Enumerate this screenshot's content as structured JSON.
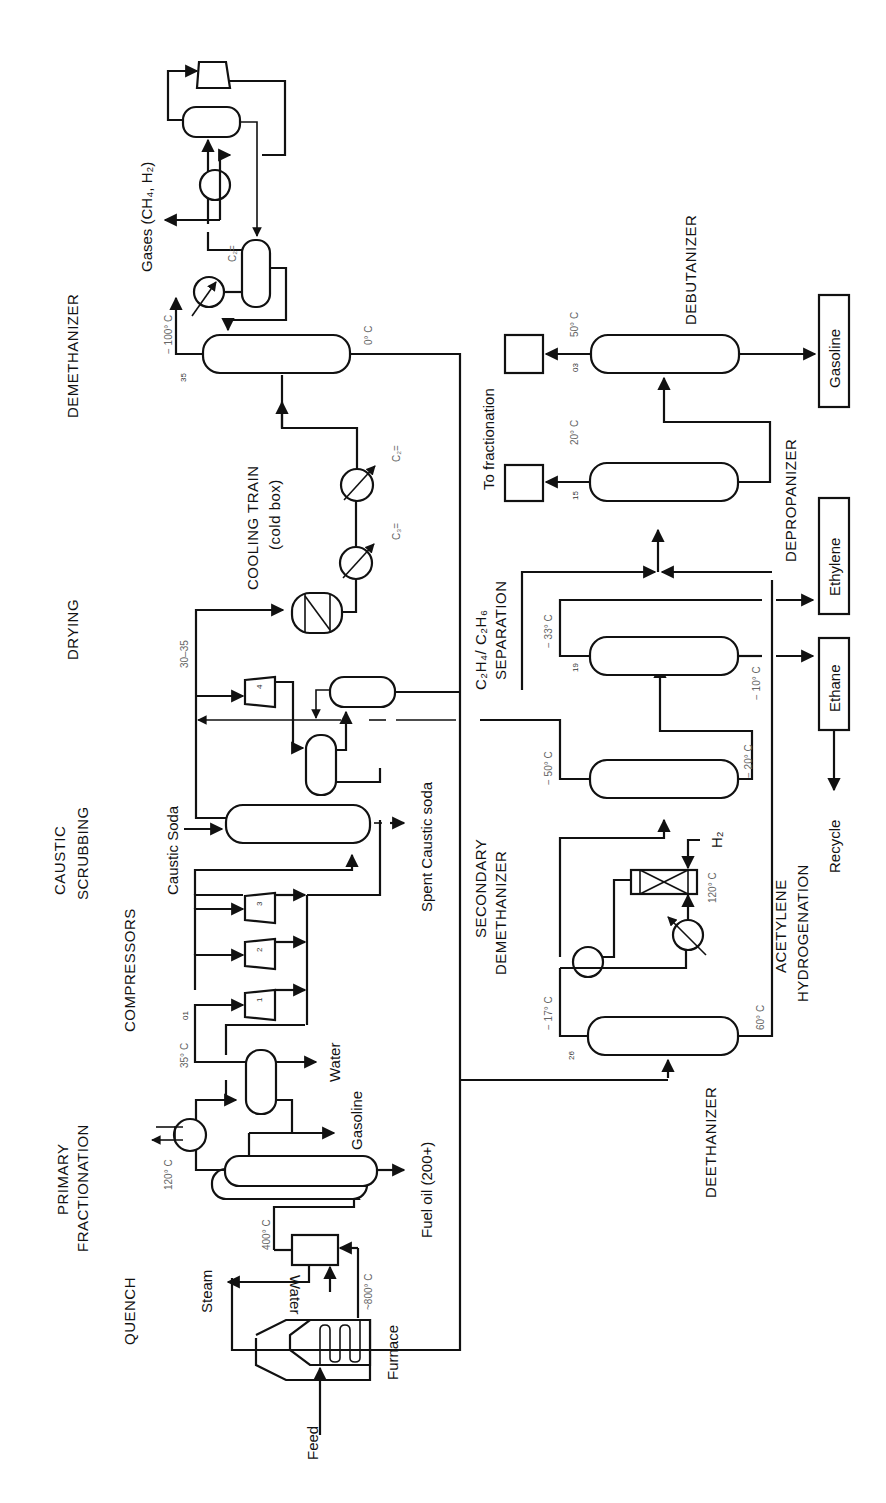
{
  "sections": {
    "quench": "QUENCH",
    "primary_1": "PRIMARY",
    "primary_2": "FRACTIONATION",
    "compressors": "COMPRESSORS",
    "caustic_1": "CAUSTIC",
    "caustic_2": "SCRUBBING",
    "drying": "DRYING",
    "cooling_1": "COOLING TRAIN",
    "cooling_2": "(cold box)",
    "demethanizer": "DEMETHANIZER",
    "secondary_1": "SECONDARY",
    "secondary_2": "DEMETHANIZER",
    "c2sep_1": "C₂H₄/ C₂H₆",
    "c2sep_2": "SEPARATION",
    "depropanizer": "DEPROPANIZER",
    "debutanizer": "DEBUTANIZER",
    "deethanizer": "DEETHANIZER",
    "acetylene_1": "ACETYLENE",
    "acetylene_2": "HYDROGENATION"
  },
  "streams": {
    "feed": "Feed",
    "furnace": "Furnace",
    "steam": "Steam",
    "water_quench": "Water",
    "fuel_oil": "Fuel oil (200+)",
    "gasoline_primary": "Gasoline",
    "water_sep": "Water",
    "caustic_soda": "Caustic Soda",
    "spent_caustic": "Spent Caustic soda",
    "gases": "Gases (CH₄, H₂)",
    "to_fractionation": "To fractionation",
    "h2": "H₂",
    "recycle": "Recycle"
  },
  "products": {
    "gasoline": "Gasoline",
    "ethylene": "Ethylene",
    "ethane": "Ethane"
  },
  "compressor_stages": [
    "1",
    "2",
    "3",
    "4"
  ],
  "refrigerants": {
    "c3": "C₃=",
    "c2_a": "C₂=",
    "c2_b": "C₂="
  },
  "conditions": {
    "furnace_out": "~800° C",
    "quench_out": "400° C",
    "primary_top": "120° C",
    "comp_in": "35° C",
    "comp_in_p": "01",
    "drying_p": "30–35",
    "demeth_p": "35",
    "demeth_top": "− 100° C",
    "demeth_bottom": "0° C",
    "deeth_p": "26",
    "deeth_top": "− 17° C",
    "deeth_bottom": "60° C",
    "hydro_t": "120° C",
    "secdem_top": "− 50° C",
    "secdem_bottom": "− 20° C",
    "c2sep_p": "19",
    "c2sep_top": "− 33° C",
    "c2sep_bottom": "− 10° C",
    "deprop_p": "15",
    "deprop_top": "20° C",
    "debut_p": "03",
    "debut_top": "50° C"
  }
}
